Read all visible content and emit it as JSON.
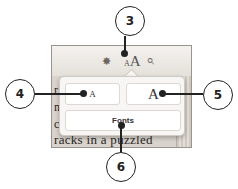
{
  "toolbar": {
    "brightness_icon": "✸",
    "font_size_icon_small": "A",
    "font_size_icon_large": "A",
    "search_icon": "⌕"
  },
  "popover": {
    "decrease_font_label": "A",
    "increase_font_label": "A",
    "fonts_label": "Fonts"
  },
  "book": {
    "line_fragments": [
      "r",
      "n",
      "c"
    ],
    "bottom_line": "racks in a puzzled"
  },
  "callouts": [
    {
      "number": "3",
      "target": "font-size-button"
    },
    {
      "number": "4",
      "target": "decrease-font-button"
    },
    {
      "number": "5",
      "target": "increase-font-button"
    },
    {
      "number": "6",
      "target": "fonts-button"
    }
  ]
}
